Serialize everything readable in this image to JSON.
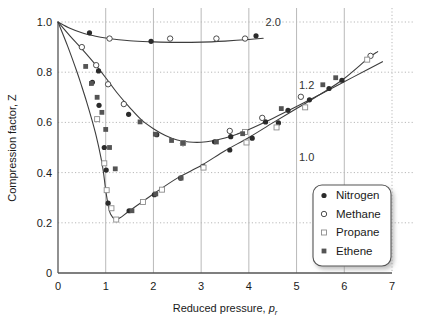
{
  "chart_data": {
    "type": "scatter",
    "title": "",
    "xlabel": "Reduced pressure, p_r",
    "xlabel_main": "Reduced pressure, ",
    "xlabel_symbol": "p",
    "xlabel_sub": "r",
    "ylabel": "Compression factor, Z",
    "ylabel_main": "Compression factor, ",
    "ylabel_symbol": "Z",
    "xlim": [
      0,
      7
    ],
    "ylim": [
      0,
      1.0
    ],
    "xticks": [
      "0",
      "1",
      "2",
      "3",
      "4",
      "5",
      "6",
      "7"
    ],
    "xtick_values": [
      0,
      1,
      2,
      3,
      4,
      5,
      6,
      7
    ],
    "yticks": [
      "0",
      "0.2",
      "0.4",
      "0.6",
      "0.8",
      "1.0"
    ],
    "ytick_values": [
      0,
      0.2,
      0.4,
      0.6,
      0.8,
      1.0
    ],
    "grid": "x-solid-y-dotted",
    "legend_position": "bottom-right",
    "legend": [
      {
        "label": "Nitrogen",
        "marker": "filled-circle"
      },
      {
        "label": "Methane",
        "marker": "open-circle"
      },
      {
        "label": "Propane",
        "marker": "open-square"
      },
      {
        "label": "Ethene",
        "marker": "filled-square"
      }
    ],
    "curve_annotations": [
      {
        "text": "2.0",
        "x": 4.35,
        "y": 0.985
      },
      {
        "text": "1.2",
        "x": 5.05,
        "y": 0.735
      },
      {
        "text": "1.0",
        "x": 5.05,
        "y": 0.445
      }
    ],
    "curves": [
      {
        "name": "Tr = 2.0",
        "label": "2.0",
        "points": [
          [
            0.0,
            1.0
          ],
          [
            0.25,
            0.975
          ],
          [
            0.5,
            0.957
          ],
          [
            0.75,
            0.945
          ],
          [
            1.0,
            0.936
          ],
          [
            1.5,
            0.925
          ],
          [
            2.0,
            0.921
          ],
          [
            2.5,
            0.919
          ],
          [
            3.0,
            0.92
          ],
          [
            3.5,
            0.924
          ],
          [
            4.0,
            0.93
          ],
          [
            4.3,
            0.935
          ]
        ]
      },
      {
        "name": "Tr = 1.2",
        "label": "1.2",
        "points": [
          [
            0.0,
            1.0
          ],
          [
            0.25,
            0.945
          ],
          [
            0.5,
            0.893
          ],
          [
            0.75,
            0.838
          ],
          [
            1.0,
            0.778
          ],
          [
            1.25,
            0.715
          ],
          [
            1.5,
            0.66
          ],
          [
            1.75,
            0.61
          ],
          [
            2.0,
            0.575
          ],
          [
            2.25,
            0.548
          ],
          [
            2.5,
            0.53
          ],
          [
            2.75,
            0.522
          ],
          [
            3.0,
            0.521
          ],
          [
            3.25,
            0.527
          ],
          [
            3.5,
            0.538
          ],
          [
            3.75,
            0.553
          ],
          [
            4.0,
            0.572
          ],
          [
            4.5,
            0.616
          ],
          [
            5.0,
            0.663
          ],
          [
            5.5,
            0.712
          ],
          [
            6.0,
            0.762
          ],
          [
            6.5,
            0.812
          ],
          [
            6.8,
            0.842
          ]
        ]
      },
      {
        "name": "Tr = 1.0",
        "label": "1.0",
        "points": [
          [
            0.0,
            1.0
          ],
          [
            0.2,
            0.905
          ],
          [
            0.4,
            0.8
          ],
          [
            0.5,
            0.742
          ],
          [
            0.6,
            0.682
          ],
          [
            0.7,
            0.617
          ],
          [
            0.8,
            0.546
          ],
          [
            0.9,
            0.46
          ],
          [
            0.95,
            0.405
          ],
          [
            1.0,
            0.33
          ],
          [
            1.05,
            0.272
          ],
          [
            1.1,
            0.235
          ],
          [
            1.2,
            0.214
          ],
          [
            1.3,
            0.22
          ],
          [
            1.5,
            0.248
          ],
          [
            2.0,
            0.315
          ],
          [
            2.5,
            0.378
          ],
          [
            3.0,
            0.428
          ],
          [
            3.5,
            0.487
          ],
          [
            4.0,
            0.54
          ],
          [
            4.5,
            0.598
          ],
          [
            5.0,
            0.655
          ],
          [
            5.5,
            0.712
          ],
          [
            6.0,
            0.775
          ],
          [
            6.5,
            0.855
          ],
          [
            6.7,
            0.882
          ]
        ]
      }
    ],
    "series": [
      {
        "name": "Nitrogen",
        "marker": "filled-circle",
        "points": [
          [
            0.66,
            0.957
          ],
          [
            1.95,
            0.923
          ],
          [
            4.15,
            0.945
          ],
          [
            0.85,
            0.805
          ],
          [
            1.48,
            0.632
          ],
          [
            2.07,
            0.551
          ],
          [
            2.62,
            0.519
          ],
          [
            3.28,
            0.523
          ],
          [
            3.62,
            0.543
          ],
          [
            4.35,
            0.602
          ],
          [
            4.82,
            0.648
          ],
          [
            5.27,
            0.69
          ],
          [
            5.68,
            0.735
          ],
          [
            5.95,
            0.768
          ],
          [
            0.72,
            0.76
          ],
          [
            0.86,
            0.668
          ],
          [
            0.97,
            0.5
          ],
          [
            1.01,
            0.41
          ],
          [
            1.05,
            0.278
          ],
          [
            1.49,
            0.248
          ],
          [
            2.02,
            0.312
          ],
          [
            2.57,
            0.378
          ],
          [
            3.04,
            0.425
          ],
          [
            3.6,
            0.49
          ],
          [
            4.07,
            0.537
          ],
          [
            4.62,
            0.598
          ]
        ]
      },
      {
        "name": "Methane",
        "marker": "open-circle",
        "points": [
          [
            1.08,
            0.934
          ],
          [
            2.35,
            0.934
          ],
          [
            3.32,
            0.934
          ],
          [
            3.92,
            0.934
          ],
          [
            0.5,
            0.9
          ],
          [
            0.8,
            0.828
          ],
          [
            1.05,
            0.752
          ],
          [
            1.38,
            0.673
          ],
          [
            2.62,
            0.517
          ],
          [
            3.6,
            0.566
          ],
          [
            4.28,
            0.618
          ],
          [
            5.09,
            0.702
          ],
          [
            6.55,
            0.865
          ]
        ]
      },
      {
        "name": "Propane",
        "marker": "open-square",
        "points": [
          [
            0.82,
            0.613
          ],
          [
            0.97,
            0.437
          ],
          [
            1.02,
            0.33
          ],
          [
            1.12,
            0.258
          ],
          [
            1.22,
            0.213
          ],
          [
            1.78,
            0.283
          ],
          [
            2.18,
            0.332
          ],
          [
            3.05,
            0.42
          ],
          [
            3.95,
            0.52
          ],
          [
            4.58,
            0.58
          ],
          [
            5.18,
            0.66
          ],
          [
            6.48,
            0.85
          ],
          [
            2.62,
            0.518
          ],
          [
            3.92,
            0.562
          ]
        ]
      },
      {
        "name": "Ethene",
        "marker": "filled-square",
        "points": [
          [
            0.58,
            0.823
          ],
          [
            0.7,
            0.755
          ],
          [
            0.82,
            0.7
          ],
          [
            0.92,
            0.64
          ],
          [
            1.0,
            0.572
          ],
          [
            1.08,
            0.5
          ],
          [
            1.2,
            0.415
          ],
          [
            1.55,
            0.248
          ],
          [
            2.05,
            0.315
          ],
          [
            2.58,
            0.378
          ],
          [
            1.72,
            0.602
          ],
          [
            2.04,
            0.553
          ],
          [
            2.38,
            0.528
          ],
          [
            2.62,
            0.518
          ],
          [
            3.32,
            0.522
          ],
          [
            3.87,
            0.555
          ],
          [
            4.68,
            0.655
          ],
          [
            5.55,
            0.75
          ],
          [
            5.82,
            0.778
          ]
        ]
      }
    ]
  }
}
